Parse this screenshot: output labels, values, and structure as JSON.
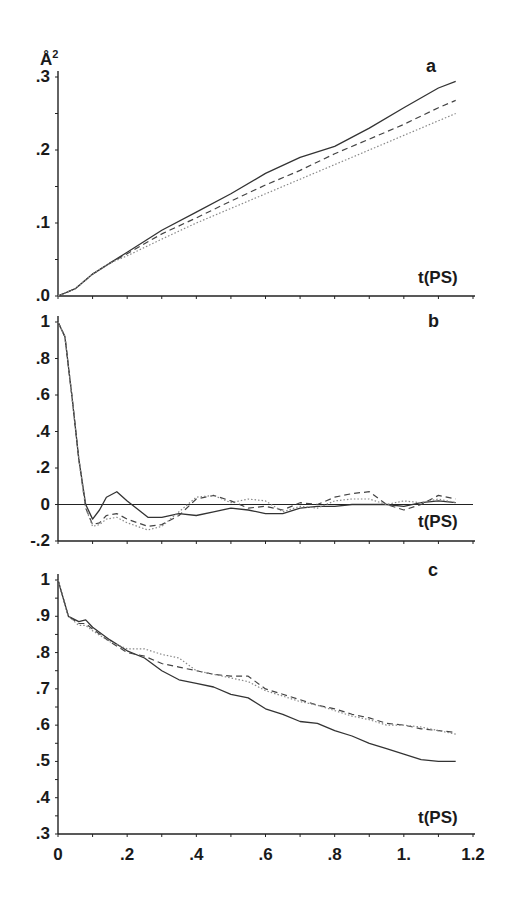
{
  "chart_data": [
    {
      "panel": "a",
      "type": "line",
      "title": "",
      "xlabel": "t(PS)",
      "ylabel": "Å²",
      "xlim": [
        0,
        1.2
      ],
      "ylim": [
        0,
        0.3
      ],
      "yticks": [
        ".0",
        ".1",
        ".2",
        ".3"
      ],
      "grid": false,
      "legend": null,
      "x": [
        0,
        0.05,
        0.1,
        0.15,
        0.2,
        0.3,
        0.4,
        0.5,
        0.6,
        0.7,
        0.8,
        0.9,
        1.0,
        1.1,
        1.15
      ],
      "series": [
        {
          "name": "solid",
          "style": "solid",
          "values": [
            0,
            0.01,
            0.03,
            0.045,
            0.06,
            0.09,
            0.115,
            0.14,
            0.168,
            0.19,
            0.205,
            0.23,
            0.258,
            0.285,
            0.294
          ]
        },
        {
          "name": "dashed",
          "style": "dashed",
          "values": [
            0,
            0.01,
            0.03,
            0.045,
            0.058,
            0.085,
            0.107,
            0.13,
            0.152,
            0.172,
            0.195,
            0.215,
            0.235,
            0.258,
            0.268
          ]
        },
        {
          "name": "dotted",
          "style": "dotted",
          "values": [
            0,
            0.01,
            0.03,
            0.045,
            0.055,
            0.078,
            0.1,
            0.12,
            0.14,
            0.16,
            0.18,
            0.2,
            0.22,
            0.24,
            0.25
          ]
        }
      ]
    },
    {
      "panel": "b",
      "type": "line",
      "title": "",
      "xlabel": "t(PS)",
      "ylabel": "",
      "xlim": [
        0,
        1.2
      ],
      "ylim": [
        -0.2,
        1.0
      ],
      "yticks": [
        "-.2",
        "0",
        ".2",
        ".4",
        ".6",
        ".8",
        "1"
      ],
      "grid": false,
      "zero_line": true,
      "legend": null,
      "x": [
        0,
        0.02,
        0.04,
        0.06,
        0.08,
        0.1,
        0.12,
        0.14,
        0.17,
        0.2,
        0.26,
        0.3,
        0.35,
        0.4,
        0.45,
        0.5,
        0.55,
        0.6,
        0.65,
        0.7,
        0.75,
        0.8,
        0.85,
        0.9,
        0.95,
        1.0,
        1.05,
        1.1,
        1.15
      ],
      "series": [
        {
          "name": "solid",
          "style": "solid",
          "values": [
            1.0,
            0.92,
            0.6,
            0.25,
            0.0,
            -0.08,
            -0.03,
            0.04,
            0.07,
            0.02,
            -0.07,
            -0.07,
            -0.05,
            -0.06,
            -0.04,
            -0.02,
            -0.03,
            -0.05,
            -0.05,
            -0.02,
            -0.01,
            -0.01,
            0.0,
            0.0,
            0.0,
            -0.01,
            0.01,
            0.02,
            0.01
          ]
        },
        {
          "name": "dashed",
          "style": "dashed",
          "values": [
            1.0,
            0.92,
            0.6,
            0.25,
            -0.02,
            -0.11,
            -0.1,
            -0.06,
            -0.05,
            -0.08,
            -0.12,
            -0.11,
            -0.06,
            0.03,
            0.05,
            0.02,
            -0.02,
            -0.01,
            -0.03,
            0.01,
            0.0,
            0.04,
            0.06,
            0.07,
            0.0,
            -0.03,
            0.0,
            0.05,
            0.03
          ]
        },
        {
          "name": "dotted",
          "style": "dotted",
          "values": [
            1.0,
            0.92,
            0.6,
            0.25,
            -0.02,
            -0.12,
            -0.11,
            -0.08,
            -0.07,
            -0.1,
            -0.14,
            -0.12,
            -0.04,
            0.04,
            0.05,
            0.01,
            0.03,
            0.02,
            -0.04,
            -0.01,
            -0.02,
            0.02,
            0.03,
            0.03,
            0.0,
            0.02,
            0.01,
            0.03,
            0.01
          ]
        }
      ]
    },
    {
      "panel": "c",
      "type": "line",
      "title": "",
      "xlabel": "t(PS)",
      "ylabel": "",
      "xlim": [
        0,
        1.2
      ],
      "ylim": [
        0.3,
        1.0
      ],
      "yticks": [
        ".3",
        ".4",
        ".5",
        ".6",
        ".7",
        ".8",
        ".9",
        "1"
      ],
      "xticks": [
        "0",
        ".2",
        ".4",
        ".6",
        ".8",
        "1.",
        "1.2"
      ],
      "grid": false,
      "legend": null,
      "x": [
        0,
        0.03,
        0.06,
        0.08,
        0.1,
        0.15,
        0.2,
        0.25,
        0.3,
        0.35,
        0.4,
        0.45,
        0.5,
        0.55,
        0.6,
        0.65,
        0.7,
        0.75,
        0.8,
        0.85,
        0.9,
        0.95,
        1.0,
        1.05,
        1.1,
        1.15
      ],
      "series": [
        {
          "name": "solid",
          "style": "solid",
          "values": [
            1.0,
            0.9,
            0.885,
            0.89,
            0.87,
            0.835,
            0.805,
            0.785,
            0.75,
            0.725,
            0.715,
            0.705,
            0.685,
            0.675,
            0.645,
            0.63,
            0.61,
            0.605,
            0.585,
            0.57,
            0.55,
            0.535,
            0.52,
            0.505,
            0.5,
            0.5
          ]
        },
        {
          "name": "dashed",
          "style": "dashed",
          "values": [
            1.0,
            0.9,
            0.88,
            0.88,
            0.865,
            0.83,
            0.8,
            0.79,
            0.77,
            0.76,
            0.75,
            0.74,
            0.735,
            0.735,
            0.7,
            0.685,
            0.67,
            0.655,
            0.645,
            0.63,
            0.62,
            0.605,
            0.6,
            0.59,
            0.585,
            0.58
          ]
        },
        {
          "name": "dotted",
          "style": "dotted",
          "values": [
            1.0,
            0.9,
            0.875,
            0.875,
            0.86,
            0.83,
            0.81,
            0.81,
            0.795,
            0.785,
            0.75,
            0.74,
            0.73,
            0.72,
            0.695,
            0.68,
            0.665,
            0.655,
            0.64,
            0.625,
            0.615,
            0.6,
            0.6,
            0.595,
            0.585,
            0.575
          ]
        }
      ]
    }
  ],
  "labels": {
    "panel_a": "a",
    "panel_b": "b",
    "panel_c": "c",
    "unit_a": "Å",
    "unit_a_sup": "2",
    "time_label": "t(PS)"
  }
}
